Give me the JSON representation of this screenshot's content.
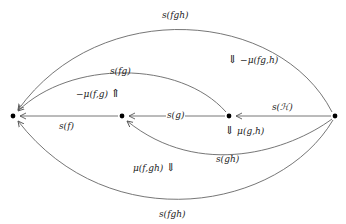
{
  "diagram": {
    "nodes": [
      {
        "id": "n0",
        "x": 13,
        "y": 116
      },
      {
        "id": "n1",
        "x": 122,
        "y": 116
      },
      {
        "id": "n2",
        "x": 229,
        "y": 116
      },
      {
        "id": "n3",
        "x": 335,
        "y": 116
      }
    ],
    "edges": [
      {
        "from": "n1",
        "to": "n0",
        "label": "s(f)"
      },
      {
        "from": "n2",
        "to": "n1",
        "label": "s(g)"
      },
      {
        "from": "n3",
        "to": "n2",
        "label": "s(ℋ)"
      },
      {
        "from": "n2",
        "to": "n0",
        "label": "s(fg)",
        "curve": "above"
      },
      {
        "from": "n3",
        "to": "n1",
        "label": "s(gh)",
        "curve": "below"
      },
      {
        "from": "n3",
        "to": "n0",
        "label": "s(fgh)",
        "curve": "far-above"
      },
      {
        "from": "n3",
        "to": "n0",
        "label": "s(fgh)",
        "curve": "far-below"
      }
    ],
    "two_cells": [
      {
        "label": "−μ(fg,h)",
        "arrow": "⇓",
        "arrow_side": "left"
      },
      {
        "label": "−μ(f,g)",
        "arrow": "⇑",
        "arrow_side": "right"
      },
      {
        "label": "μ(g,h)",
        "arrow": "⇓",
        "arrow_side": "left"
      },
      {
        "label": "μ(f,gh)",
        "arrow": "⇓",
        "arrow_side": "right"
      }
    ],
    "colors": {
      "line": "#555555",
      "node": "#000000",
      "text": "#222222"
    }
  }
}
